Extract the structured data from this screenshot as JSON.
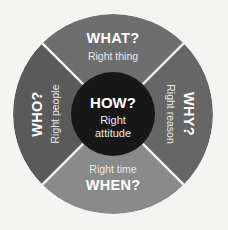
{
  "diagram": {
    "background_color": "#f4f4f2",
    "outer_circle": {
      "center_x": 113,
      "center_y": 114,
      "radius": 100,
      "divider_color": "#f4f4f2"
    },
    "hub": {
      "radius": 42,
      "color": "#171717",
      "heading": "HOW?",
      "sub_line_1": "Right",
      "sub_line_2": "attitude",
      "heading_color": "#ffffff",
      "sub_color": "#ededec"
    },
    "segments": [
      {
        "id": "what",
        "position": "top",
        "heading": "WHAT?",
        "subtitle": "Right thing",
        "color": "#6e6e6e",
        "text_color": "#ffffff",
        "rotation_deg": 0,
        "heading_first": true
      },
      {
        "id": "why",
        "position": "right",
        "heading": "WHY?",
        "subtitle": "Right reason",
        "color": "#666666",
        "text_color": "#ffffff",
        "rotation_deg": 90,
        "heading_first": true
      },
      {
        "id": "when",
        "position": "bottom",
        "heading": "WHEN?",
        "subtitle": "Right time",
        "color": "#8a8a8a",
        "text_color": "#ffffff",
        "rotation_deg": 0,
        "heading_first": false
      },
      {
        "id": "who",
        "position": "left",
        "heading": "WHO?",
        "subtitle": "Right people",
        "color": "#5a5a5a",
        "text_color": "#ffffff",
        "rotation_deg": -90,
        "heading_first": true
      }
    ]
  }
}
